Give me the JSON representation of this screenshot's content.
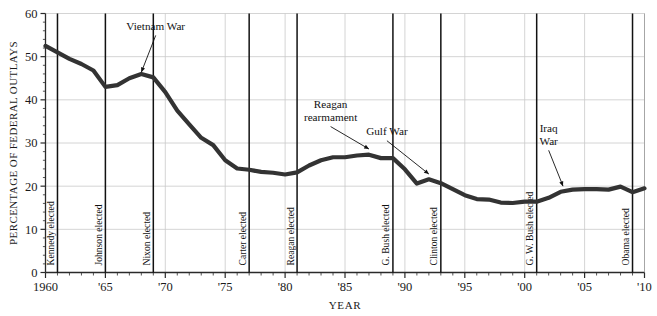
{
  "chart_data": {
    "type": "line",
    "title": "",
    "xlabel": "YEAR",
    "ylabel": "PERCENTAGE OF FEDERAL OUTLAYS",
    "xlim": [
      1960,
      2010
    ],
    "ylim": [
      0,
      60
    ],
    "ytick_labels": [
      "0",
      "10",
      "20",
      "30",
      "40",
      "50",
      "60"
    ],
    "ytick_values": [
      0,
      10,
      20,
      30,
      40,
      50,
      60
    ],
    "xtick_labels": [
      "1960",
      "'65",
      "'70",
      "'75",
      "'80",
      "'85",
      "'90",
      "'95",
      "'00",
      "'05",
      "'10"
    ],
    "xtick_values": [
      1960,
      1965,
      1970,
      1975,
      1980,
      1985,
      1990,
      1995,
      2000,
      2005,
      2010
    ],
    "grid": true,
    "legend": "none",
    "series": [
      {
        "name": "Defense share of federal outlays",
        "color": "#333333",
        "x": [
          1960,
          1961,
          1962,
          1963,
          1964,
          1965,
          1966,
          1967,
          1968,
          1969,
          1970,
          1971,
          1972,
          1973,
          1974,
          1975,
          1976,
          1977,
          1978,
          1979,
          1980,
          1981,
          1982,
          1983,
          1984,
          1985,
          1986,
          1987,
          1988,
          1989,
          1990,
          1991,
          1992,
          1993,
          1994,
          1995,
          1996,
          1997,
          1998,
          1999,
          2000,
          2001,
          2002,
          2003,
          2004,
          2005,
          2006,
          2007,
          2008,
          2009,
          2010
        ],
        "values": [
          52.5,
          51.0,
          49.5,
          48.3,
          46.8,
          43.0,
          43.4,
          45.0,
          46.0,
          45.2,
          41.8,
          37.5,
          34.3,
          31.2,
          29.5,
          26.0,
          24.1,
          23.8,
          23.3,
          23.1,
          22.7,
          23.2,
          24.8,
          26.0,
          26.7,
          26.7,
          27.1,
          27.3,
          26.5,
          26.5,
          23.9,
          20.6,
          21.6,
          20.7,
          19.3,
          17.9,
          17.0,
          16.9,
          16.2,
          16.1,
          16.4,
          16.4,
          17.3,
          18.7,
          19.2,
          19.3,
          19.3,
          19.2,
          19.9,
          18.6,
          19.5
        ]
      }
    ],
    "event_lines": [
      {
        "label": "Kennedy elected",
        "year": 1961
      },
      {
        "label": "Johnson elected",
        "year": 1965
      },
      {
        "label": "Nixon elected",
        "year": 1969
      },
      {
        "label": "Carter elected",
        "year": 1977
      },
      {
        "label": "Reagan elected",
        "year": 1981
      },
      {
        "label": "G. Bush elected",
        "year": 1989
      },
      {
        "label": "Clinton elected",
        "year": 1993
      },
      {
        "label": "G. W. Bush elected",
        "year": 2001
      },
      {
        "label": "Obama elected",
        "year": 2009
      }
    ],
    "annotations": [
      {
        "label": "Vietnam War",
        "lines": [
          "Vietnam War"
        ],
        "text_year": 1969.2,
        "text_value": 56.2,
        "point_year": 1968.0,
        "point_value": 46.4
      },
      {
        "label": "Reagan rearmament",
        "lines": [
          "Reagan",
          "rearmament"
        ],
        "text_year": 1983.8,
        "text_value": 38.0,
        "point_year": 1987.0,
        "point_value": 28.6
      },
      {
        "label": "Gulf War",
        "lines": [
          "Gulf War"
        ],
        "text_year": 1988.5,
        "text_value": 31.8,
        "point_year": 1992.0,
        "point_value": 22.8
      },
      {
        "label": "Iraq War",
        "lines": [
          "Iraq",
          "War"
        ],
        "text_year": 2002.0,
        "text_value": 32.5,
        "point_year": 2003.2,
        "point_value": 20.0
      }
    ]
  }
}
